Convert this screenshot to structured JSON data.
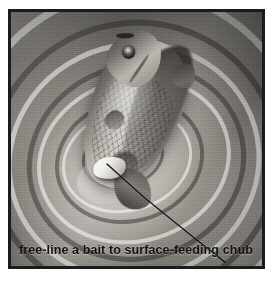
{
  "figure": {
    "caption": "free-line a bait to surface-feeding chub",
    "medium": "monochrome painted illustration",
    "border_color": "#1b1b1b",
    "background_color": "#ffffff",
    "water_tone": "#9d9a94",
    "highlight_tone": "#d6d4ce",
    "shadow_tone": "#4d4a46"
  },
  "scene": {
    "fish": {
      "name": "chub",
      "label": "chub",
      "orientation_deg": 22,
      "body_tone": "#a7a49d",
      "dorsal_tone": "#2f2d2a",
      "eye_color": "#171614"
    },
    "bait": {
      "name": "free-lined bait",
      "label": "bait",
      "color": "#fdfcfa"
    },
    "line": {
      "name": "fishing line",
      "label": "free line",
      "color": "#17161a",
      "style": "thin dark diagonal running from bait to lower-right"
    },
    "water": {
      "name": "rippled water surface",
      "label": "concentric ripples",
      "ring_count": 11
    }
  }
}
